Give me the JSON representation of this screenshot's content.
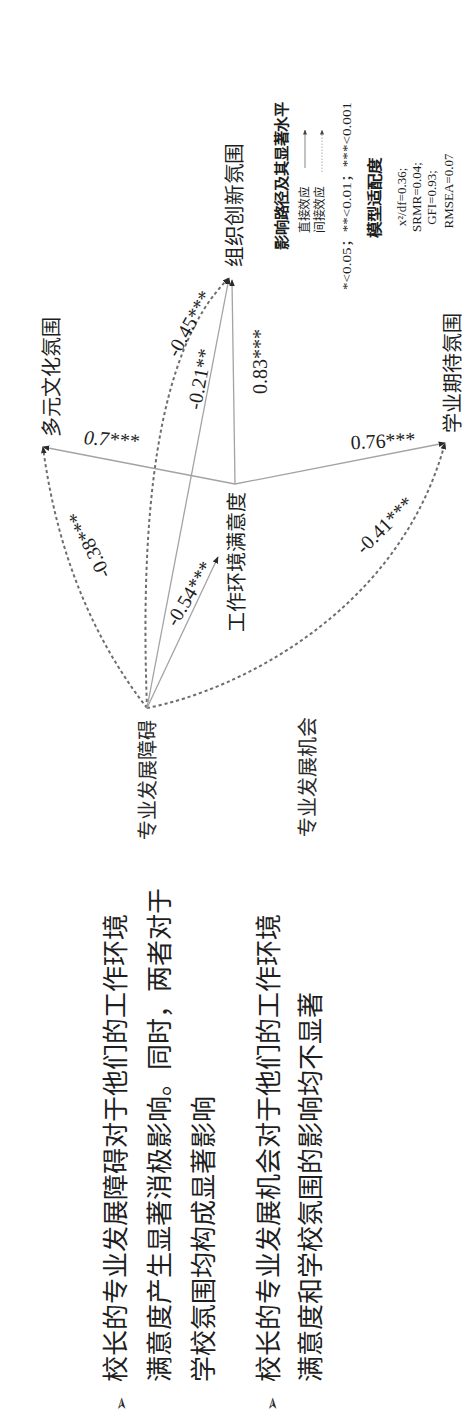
{
  "slide": {
    "bullets": [
      {
        "marker": "➢",
        "lines": [
          "校长的专业发展障碍对于他们的工作环境",
          "满意度产生显著消极影响。同时，两者对于",
          "学校氛围均构成显著影响"
        ]
      },
      {
        "marker": "➢",
        "lines": [
          "校长的专业发展机会对于他们的工作环境",
          "满意度和学校氛围的影响均不显著"
        ]
      }
    ]
  },
  "diagram": {
    "nodes": {
      "barrier": "专业发展障碍",
      "opportunity": "专业发展机会",
      "satisfaction": "工作环境满意度",
      "innovation": "组织创新氛围",
      "multicultural": "多元文化氛围",
      "academic": "学业期待氛围"
    },
    "paths": [
      {
        "from": "专业发展障碍",
        "to": "工作环境满意度",
        "type": "direct",
        "coef": "-0.54***"
      },
      {
        "from": "专业发展障碍",
        "to": "组织创新氛围",
        "type": "direct",
        "coef": "-0.21**"
      },
      {
        "from": "工作环境满意度",
        "to": "组织创新氛围",
        "type": "direct",
        "coef": "0.83***"
      },
      {
        "from": "工作环境满意度",
        "to": "多元文化氛围",
        "type": "direct",
        "coef": "0.7***"
      },
      {
        "from": "工作环境满意度",
        "to": "学业期待氛围",
        "type": "direct",
        "coef": "0.76***"
      },
      {
        "from": "专业发展障碍",
        "to": "组织创新氛围",
        "type": "indirect",
        "coef": "-0.45***"
      },
      {
        "from": "专业发展障碍",
        "to": "多元文化氛围",
        "type": "indirect",
        "coef": "-0.38***"
      },
      {
        "from": "专业发展障碍",
        "to": "学业期待氛围",
        "type": "indirect",
        "coef": "-0.41***"
      }
    ],
    "legend": {
      "title": "影响路径及其显著水平",
      "direct_label": "直接效应",
      "indirect_label": "间接效应",
      "significance": "*<0.05；**<0.01；***<0.001"
    },
    "model_fit": {
      "title": "模型适配度",
      "lines": [
        "x²/df=0.36;",
        "SRMR=0.04;",
        "GFI=0.93;",
        "RMSEA=0.07"
      ]
    }
  },
  "colors": {
    "text": "#1e1e1e",
    "direct_line": "#a3a3a3",
    "indirect_line": "#6e6e6e",
    "arrowhead": "#2a2a2a",
    "background": "#ffffff"
  }
}
